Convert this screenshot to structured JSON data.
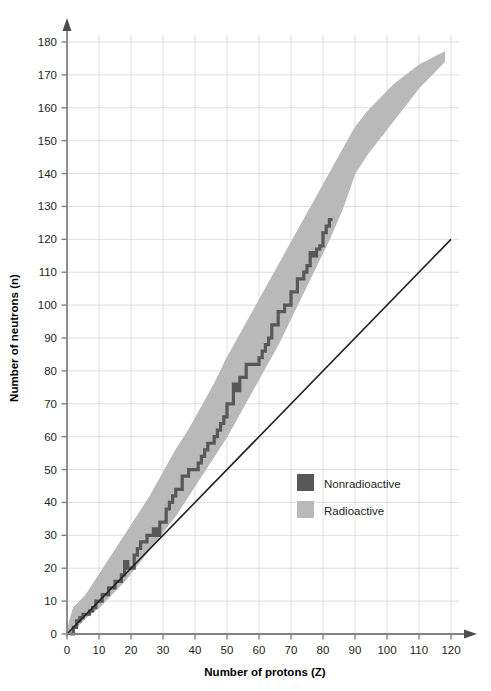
{
  "chart_data": {
    "type": "scatter",
    "title": "",
    "xlabel": "Number of protons (Z)",
    "ylabel": "Number of neutrons (n)",
    "xlim": [
      0,
      120
    ],
    "ylim": [
      0,
      180
    ],
    "xticks": [
      0,
      10,
      20,
      30,
      40,
      50,
      60,
      70,
      80,
      90,
      100,
      110,
      120
    ],
    "yticks": [
      0,
      10,
      20,
      30,
      40,
      50,
      60,
      70,
      80,
      90,
      100,
      110,
      120,
      130,
      140,
      150,
      160,
      170,
      180
    ],
    "grid": true,
    "legend_position": "inside-center-right",
    "legend": [
      {
        "label": "Nonradioactive",
        "color": "#58585a"
      },
      {
        "label": "Radioactive",
        "color": "#b9b9b9"
      }
    ],
    "series": [
      {
        "name": "Radioactive",
        "type": "band",
        "color": "#b9b9b9",
        "comment": "Region of known radioactive nuclides; polygon of (Z,N) vertices",
        "upper_boundary": [
          [
            0,
            1
          ],
          [
            2,
            8
          ],
          [
            6,
            12
          ],
          [
            10,
            18
          ],
          [
            14,
            24
          ],
          [
            18,
            30
          ],
          [
            22,
            36
          ],
          [
            26,
            42
          ],
          [
            30,
            49
          ],
          [
            34,
            56
          ],
          [
            38,
            62
          ],
          [
            42,
            69
          ],
          [
            46,
            76
          ],
          [
            50,
            84
          ],
          [
            54,
            91
          ],
          [
            58,
            98
          ],
          [
            62,
            105
          ],
          [
            66,
            112
          ],
          [
            70,
            119
          ],
          [
            74,
            126
          ],
          [
            78,
            133
          ],
          [
            82,
            140
          ],
          [
            86,
            147
          ],
          [
            90,
            154
          ],
          [
            94,
            159
          ],
          [
            98,
            163
          ],
          [
            102,
            167
          ],
          [
            106,
            170
          ],
          [
            110,
            173
          ],
          [
            114,
            175
          ],
          [
            118,
            177
          ]
        ],
        "lower_boundary": [
          [
            118,
            174
          ],
          [
            114,
            170
          ],
          [
            110,
            166
          ],
          [
            106,
            161
          ],
          [
            102,
            156
          ],
          [
            98,
            151
          ],
          [
            94,
            146
          ],
          [
            90,
            140
          ],
          [
            86,
            129
          ],
          [
            82,
            120
          ],
          [
            78,
            112
          ],
          [
            74,
            104
          ],
          [
            70,
            96
          ],
          [
            66,
            88
          ],
          [
            62,
            81
          ],
          [
            58,
            74
          ],
          [
            54,
            67
          ],
          [
            50,
            60
          ],
          [
            46,
            54
          ],
          [
            42,
            48
          ],
          [
            38,
            42
          ],
          [
            34,
            36
          ],
          [
            30,
            31
          ],
          [
            26,
            26
          ],
          [
            22,
            21
          ],
          [
            18,
            16
          ],
          [
            14,
            12
          ],
          [
            10,
            8
          ],
          [
            6,
            5
          ],
          [
            2,
            1
          ],
          [
            0,
            0
          ]
        ]
      },
      {
        "name": "Nonradioactive",
        "type": "band-of-stability",
        "color": "#58585a",
        "comment": "Stair-step band of stable nuclides, (Z,N) from Z=1 to Z=83",
        "points": [
          [
            1,
            0
          ],
          [
            2,
            2
          ],
          [
            3,
            4
          ],
          [
            4,
            5
          ],
          [
            5,
            6
          ],
          [
            6,
            6
          ],
          [
            7,
            7
          ],
          [
            8,
            8
          ],
          [
            9,
            10
          ],
          [
            10,
            10
          ],
          [
            11,
            12
          ],
          [
            12,
            12
          ],
          [
            13,
            14
          ],
          [
            14,
            14
          ],
          [
            15,
            16
          ],
          [
            16,
            16
          ],
          [
            17,
            18
          ],
          [
            18,
            22
          ],
          [
            19,
            20
          ],
          [
            20,
            20
          ],
          [
            21,
            24
          ],
          [
            22,
            26
          ],
          [
            23,
            28
          ],
          [
            24,
            28
          ],
          [
            25,
            30
          ],
          [
            26,
            30
          ],
          [
            27,
            32
          ],
          [
            28,
            30
          ],
          [
            29,
            34
          ],
          [
            30,
            34
          ],
          [
            31,
            38
          ],
          [
            32,
            40
          ],
          [
            33,
            42
          ],
          [
            34,
            44
          ],
          [
            35,
            44
          ],
          [
            36,
            48
          ],
          [
            37,
            48
          ],
          [
            38,
            50
          ],
          [
            39,
            50
          ],
          [
            40,
            50
          ],
          [
            41,
            52
          ],
          [
            42,
            54
          ],
          [
            43,
            56
          ],
          [
            44,
            58
          ],
          [
            45,
            58
          ],
          [
            46,
            60
          ],
          [
            47,
            62
          ],
          [
            48,
            64
          ],
          [
            49,
            66
          ],
          [
            50,
            70
          ],
          [
            51,
            70
          ],
          [
            52,
            76
          ],
          [
            53,
            74
          ],
          [
            54,
            78
          ],
          [
            55,
            78
          ],
          [
            56,
            82
          ],
          [
            57,
            82
          ],
          [
            58,
            82
          ],
          [
            59,
            82
          ],
          [
            60,
            84
          ],
          [
            61,
            86
          ],
          [
            62,
            88
          ],
          [
            63,
            90
          ],
          [
            64,
            94
          ],
          [
            65,
            94
          ],
          [
            66,
            98
          ],
          [
            67,
            98
          ],
          [
            68,
            100
          ],
          [
            69,
            100
          ],
          [
            70,
            104
          ],
          [
            71,
            104
          ],
          [
            72,
            108
          ],
          [
            73,
            108
          ],
          [
            74,
            110
          ],
          [
            75,
            112
          ],
          [
            76,
            116
          ],
          [
            77,
            115
          ],
          [
            78,
            117
          ],
          [
            79,
            118
          ],
          [
            80,
            122
          ],
          [
            81,
            124
          ],
          [
            82,
            126
          ],
          [
            83,
            126
          ]
        ]
      },
      {
        "name": "N = Z reference line",
        "type": "line",
        "color": "#231f20",
        "points": [
          [
            0,
            0
          ],
          [
            120,
            120
          ]
        ]
      }
    ]
  },
  "axes": {
    "x_title": "Number of protons (Z)",
    "y_title": "Number of neutrons (n)",
    "x_tick_labels": [
      "0",
      "10",
      "20",
      "30",
      "40",
      "50",
      "60",
      "70",
      "80",
      "90",
      "100",
      "110",
      "120"
    ],
    "y_tick_labels": [
      "0",
      "10",
      "20",
      "30",
      "40",
      "50",
      "60",
      "70",
      "80",
      "90",
      "100",
      "110",
      "120",
      "130",
      "140",
      "150",
      "160",
      "170",
      "180"
    ]
  },
  "legend": {
    "items": [
      {
        "label": "Nonradioactive",
        "swatch_color": "#58585a"
      },
      {
        "label": "Radioactive",
        "swatch_color": "#b9b9b9"
      }
    ]
  },
  "colors": {
    "radioactive_band": "#b9b9b9",
    "stable_band": "#58585a",
    "axis": "#808285",
    "grid": "#d9d9d9",
    "text": "#231f20",
    "background": "#ffffff"
  }
}
